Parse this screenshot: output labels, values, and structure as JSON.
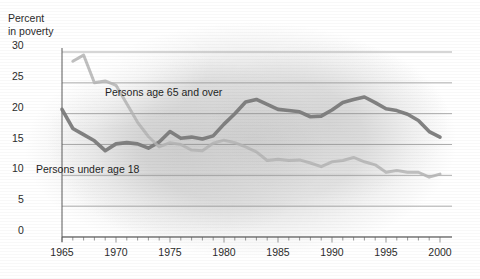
{
  "chart_data": {
    "type": "line",
    "title": "",
    "ylabel": "Percent\nin poverty",
    "xlabel": "",
    "ylim": [
      0,
      30
    ],
    "xlim": [
      1965,
      2000
    ],
    "yticks": [
      "0",
      "5",
      "10",
      "15",
      "20",
      "25",
      "30"
    ],
    "ytick_values": [
      0,
      5,
      10,
      15,
      20,
      25,
      30
    ],
    "xticks": [
      "1965",
      "1970",
      "1975",
      "1980",
      "1985",
      "1990",
      "1995",
      "2000"
    ],
    "xtick_values": [
      1965,
      1970,
      1975,
      1980,
      1985,
      1990,
      1995,
      2000
    ],
    "grid": true,
    "legend": "inline-annotations",
    "minor_xticks": "every year",
    "x": [
      1965,
      1966,
      1967,
      1968,
      1969,
      1970,
      1971,
      1972,
      1973,
      1974,
      1975,
      1976,
      1977,
      1978,
      1979,
      1980,
      1981,
      1982,
      1983,
      1984,
      1985,
      1986,
      1987,
      1988,
      1989,
      1990,
      1991,
      1992,
      1993,
      1994,
      1995,
      1996,
      1997,
      1998,
      1999,
      2000
    ],
    "series": [
      {
        "name": "Persons under age 18",
        "color": "#7b7b7b",
        "label_x": 36,
        "label_y": 163,
        "values": [
          20.7,
          17.6,
          16.6,
          15.6,
          14.0,
          15.1,
          15.3,
          15.1,
          14.4,
          15.4,
          17.1,
          16.0,
          16.2,
          15.9,
          16.4,
          18.3,
          20.0,
          21.9,
          22.3,
          21.5,
          20.7,
          20.5,
          20.3,
          19.5,
          19.6,
          20.6,
          21.8,
          22.3,
          22.7,
          21.8,
          20.8,
          20.5,
          19.9,
          18.9,
          17.1,
          16.2
        ]
      },
      {
        "name": "Persons age 65 and over",
        "color": "#b4b4b4",
        "label_x": 105,
        "label_y": 86,
        "values": [
          null,
          28.5,
          29.5,
          25.0,
          25.3,
          24.6,
          21.6,
          18.6,
          16.3,
          14.6,
          15.3,
          15.0,
          14.1,
          14.0,
          15.2,
          15.7,
          15.3,
          14.6,
          13.8,
          12.4,
          12.6,
          12.4,
          12.5,
          12.0,
          11.4,
          12.2,
          12.4,
          12.9,
          12.2,
          11.7,
          10.5,
          10.8,
          10.5,
          10.5,
          9.7,
          10.2
        ]
      }
    ]
  }
}
